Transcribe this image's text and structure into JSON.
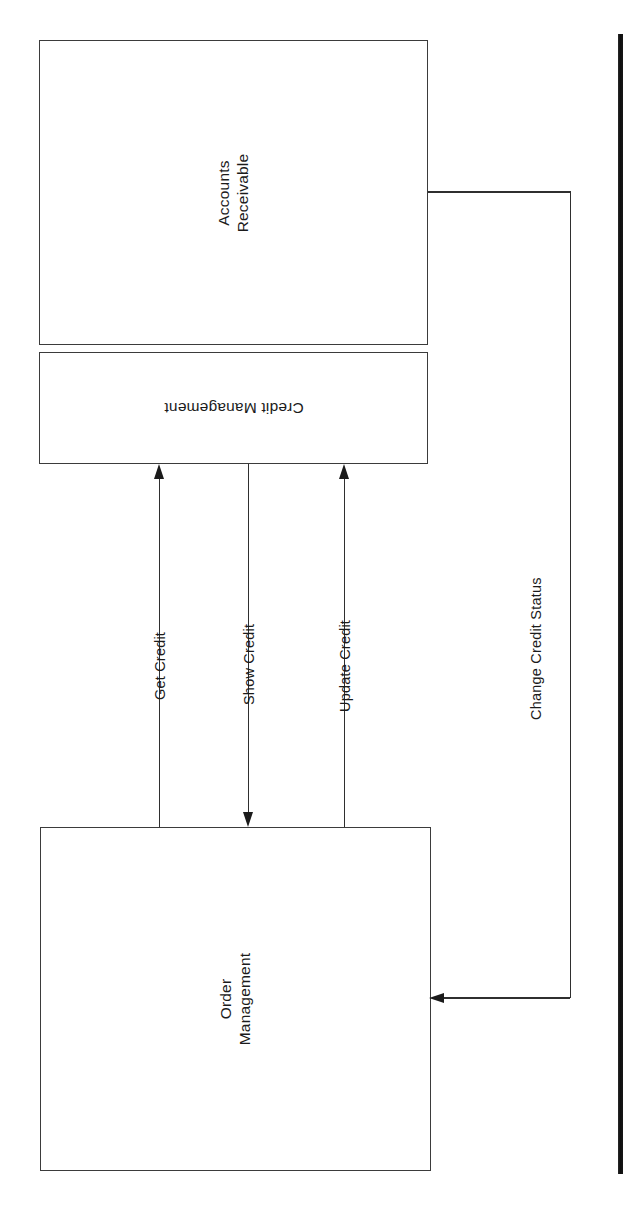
{
  "diagram": {
    "type": "component-interaction-diagram",
    "orientation": "rotated-90-ccw",
    "background_color": "#ffffff",
    "line_color": "#2f2f2f",
    "text_color": "#1b1b1b",
    "nodes": [
      {
        "id": "accounts-receivable",
        "label": "Accounts\nReceivable",
        "text_rotation": "-90",
        "x": 39,
        "y": 40,
        "width": 389,
        "height": 305
      },
      {
        "id": "credit-management",
        "label": "Credit Management",
        "text_rotation": "180",
        "x": 39,
        "y": 352,
        "width": 389,
        "height": 112
      },
      {
        "id": "order-management",
        "label": "Order\nManagement",
        "text_rotation": "-90",
        "x": 40,
        "y": 827,
        "width": 391,
        "height": 344
      }
    ],
    "edges": [
      {
        "id": "get-credit",
        "label": "Get Credit",
        "from": "order-management",
        "to": "credit-management",
        "direction": "up"
      },
      {
        "id": "show-credit",
        "label": "Show Credit",
        "from": "credit-management",
        "to": "order-management",
        "direction": "down"
      },
      {
        "id": "update-credit",
        "label": "Update Credit",
        "from": "order-management",
        "to": "credit-management",
        "direction": "up"
      },
      {
        "id": "change-credit-status",
        "label": "Change Credit Status",
        "from": "accounts-receivable",
        "to": "order-management",
        "direction": "left"
      }
    ],
    "artifacts": [
      {
        "id": "scan-edge-bar",
        "kind": "page-edge-shadow",
        "color": "#0d0d0d"
      }
    ]
  }
}
